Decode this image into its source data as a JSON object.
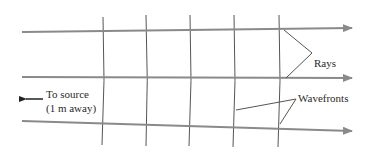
{
  "diagram": {
    "labels": {
      "rays": "Rays",
      "wavefronts": "Wavefronts",
      "source_line1": "To source",
      "source_line2": "(1 m away)"
    },
    "rays": [
      {
        "name": "ray-top",
        "x1": 22,
        "y1": 32,
        "x2": 352,
        "y2": 28
      },
      {
        "name": "ray-middle",
        "x1": 22,
        "y1": 77,
        "x2": 352,
        "y2": 78
      },
      {
        "name": "ray-bottom",
        "x1": 22,
        "y1": 120,
        "x2": 352,
        "y2": 131
      }
    ],
    "wavefronts_x": [
      104,
      147,
      190,
      234,
      279
    ],
    "colors": {
      "ray": "#8a8a8a",
      "wavefront": "#555555",
      "leader": "#555555",
      "text": "#2a2a2a",
      "source_arrow": "#222222"
    }
  }
}
